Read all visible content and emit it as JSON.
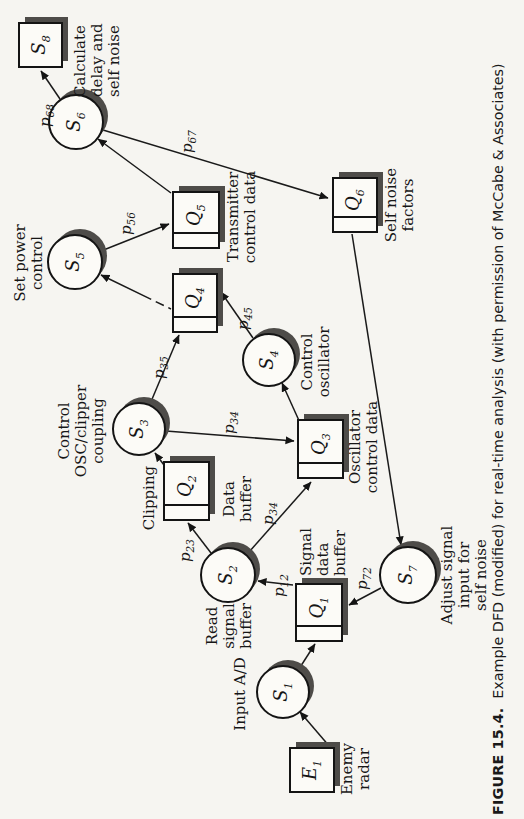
{
  "figure": {
    "caption_label": "FIGURE 15.4.",
    "caption_text": "Example DFD (modified) for real-time analysis (with permission of McCabe & Associates)"
  },
  "diagram": {
    "externals": [
      {
        "id_base": "E",
        "id_sub": "1",
        "label": "Enemy\nradar"
      }
    ],
    "processes": [
      {
        "id_base": "S",
        "id_sub": "1",
        "label": "Input A/D"
      },
      {
        "id_base": "S",
        "id_sub": "2",
        "label": "Read\nsignal\nbuffer"
      },
      {
        "id_base": "S",
        "id_sub": "3",
        "label": "Control\nOSC/clipper\ncoupling"
      },
      {
        "id_base": "S",
        "id_sub": "4",
        "label": "Control\noscillator"
      },
      {
        "id_base": "S",
        "id_sub": "5",
        "label": "Set power\ncontrol"
      },
      {
        "id_base": "S",
        "id_sub": "6",
        "label": "Calculate\ndelay and\nself noise"
      },
      {
        "id_base": "S",
        "id_sub": "7",
        "label": "Adjust signal\ninput for\nself noise"
      },
      {
        "id_base": "S",
        "id_sub": "8",
        "label": ""
      }
    ],
    "stores": [
      {
        "id_base": "Q",
        "id_sub": "1",
        "label": "Signal\ndata\nbuffer"
      },
      {
        "id_base": "Q",
        "id_sub": "2",
        "label_above": "Clipping",
        "label_below": "Data\nbuffer"
      },
      {
        "id_base": "Q",
        "id_sub": "3",
        "label": "Oscillator\ncontrol data"
      },
      {
        "id_base": "Q",
        "id_sub": "4",
        "label": ""
      },
      {
        "id_base": "Q",
        "id_sub": "5",
        "label": "Transmitter\ncontrol data"
      },
      {
        "id_base": "Q",
        "id_sub": "6",
        "label": "Self noise\nfactors"
      }
    ],
    "flows": [
      {
        "from": "E1",
        "to": "S1"
      },
      {
        "from": "S1",
        "to": "Q1"
      },
      {
        "from": "Q1",
        "to": "S2",
        "label_base": "p",
        "label_sub": "12"
      },
      {
        "from": "S2",
        "to": "Q2",
        "label_base": "p",
        "label_sub": "23"
      },
      {
        "from": "Q2",
        "to": "S3"
      },
      {
        "from": "S3",
        "to": "Q4",
        "label_base": "p",
        "label_sub": "35"
      },
      {
        "from": "S3",
        "to": "Q3",
        "label_base": "p",
        "label_sub": "34"
      },
      {
        "from": "S2",
        "to": "Q3",
        "label_base": "p",
        "label_sub": "34"
      },
      {
        "from": "Q3",
        "to": "S4"
      },
      {
        "from": "S4",
        "to": "Q4",
        "label_base": "p",
        "label_sub": "45"
      },
      {
        "from": "Q4",
        "to": "S5"
      },
      {
        "from": "S5",
        "to": "Q5",
        "label_base": "p",
        "label_sub": "56"
      },
      {
        "from": "Q5",
        "to": "S6"
      },
      {
        "from": "S6",
        "to": "S8",
        "label_base": "p",
        "label_sub": "68"
      },
      {
        "from": "S6",
        "to": "Q6",
        "label_base": "p",
        "label_sub": "67"
      },
      {
        "from": "Q6",
        "to": "S7"
      },
      {
        "from": "S7",
        "to": "Q1",
        "label_base": "p",
        "label_sub": "72"
      }
    ]
  }
}
